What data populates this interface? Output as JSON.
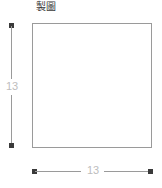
{
  "title": "製圖",
  "shape": {
    "kind": "square",
    "fill_color": "#ffffff",
    "stroke_color": "#9a9a9a"
  },
  "dimensions": {
    "height": {
      "label": "13",
      "orientation": "vertical",
      "color": "#bdbdbd"
    },
    "width": {
      "label": "13",
      "orientation": "horizontal",
      "color": "#bdbdbd"
    }
  },
  "chart_data": {
    "type": "diagram",
    "title": "製圖",
    "shapes": [
      {
        "type": "rectangle",
        "width": 13,
        "height": 13,
        "units": "",
        "fill": "#ffffff",
        "stroke": "#9a9a9a"
      }
    ],
    "annotations": [
      {
        "text": "13",
        "role": "height-dimension",
        "position": "left"
      },
      {
        "text": "13",
        "role": "width-dimension",
        "position": "bottom"
      }
    ]
  }
}
